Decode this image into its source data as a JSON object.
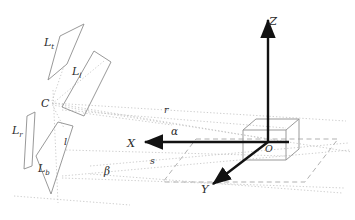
{
  "figure": {
    "colors": {
      "axis": "#121212",
      "panel_stroke": "#8c8c8c",
      "cube_stroke": "#9a9a9a",
      "dotted_ray": "#b9b9b9",
      "dashed_plane": "#a8a8a8",
      "label": "#2b2b2b",
      "background": "#ffffff"
    }
  },
  "labels": {
    "light_top": {
      "base": "L",
      "sub": "t",
      "x": 47,
      "y": 42
    },
    "light_left": {
      "base": "L",
      "sub": "l",
      "x": 75,
      "y": 71
    },
    "light_right": {
      "base": "L",
      "sub": "r",
      "x": 17,
      "y": 130
    },
    "light_bottom": {
      "base": "L",
      "sub": "b",
      "x": 41,
      "y": 168
    },
    "camera": {
      "text": "C",
      "x": 44,
      "y": 103
    },
    "baseline": {
      "text": "l",
      "x": 66,
      "y": 141
    },
    "dist_r": {
      "text": "r",
      "x": 166,
      "y": 110
    },
    "dist_s": {
      "text": "s",
      "x": 152,
      "y": 161
    },
    "angle_alpha": {
      "text": "α",
      "x": 175,
      "y": 131
    },
    "angle_beta": {
      "text": "β",
      "x": 108,
      "y": 171
    },
    "axis_x": {
      "text": "X",
      "x": 132,
      "y": 146
    },
    "axis_y": {
      "text": "Y",
      "x": 205,
      "y": 189
    },
    "axis_z": {
      "text": "Z",
      "x": 274,
      "y": 21
    },
    "origin": {
      "text": "O",
      "x": 268,
      "y": 148
    }
  },
  "geometry": {
    "panels": [
      {
        "name": "light-top-panel",
        "points": "58,37 82,25 68,63 49,79"
      },
      {
        "name": "light-left-panel",
        "points": "61,106 93,52 110,62 83,115"
      },
      {
        "name": "light-right-panel",
        "points": "26,116 34,113 31,166 23,168"
      },
      {
        "name": "light-bottom-panel",
        "points": "35,155 57,122 72,125 50,193"
      }
    ],
    "cube": {
      "front": "243,130 286,130 286,160 243,160",
      "top_back": "256,119 299,119 299,149",
      "edges": [
        "243,130 256,119",
        "286,130 299,119",
        "286,160 299,149"
      ]
    },
    "axes": {
      "x_arrow": {
        "x1": 287,
        "y1": 142,
        "x2": 141,
        "y2": 142
      },
      "y_arrow": {
        "x1": 268,
        "y1": 142,
        "x2": 211,
        "y2": 186
      },
      "z_arrow": {
        "x1": 268,
        "y1": 142,
        "x2": 268,
        "y2": 18
      }
    },
    "ground_plane": "196,139 338,139 305,182 163,182",
    "dotted_rays": [
      "52,104 340,124",
      "52,104 255,141",
      "52,104 350,150",
      "60,175 348,154",
      "60,175 340,186",
      "119,170 345,143"
    ],
    "vertical_guide": {
      "x1": 53,
      "y1": 92,
      "x2": 58,
      "y2": 200
    }
  }
}
